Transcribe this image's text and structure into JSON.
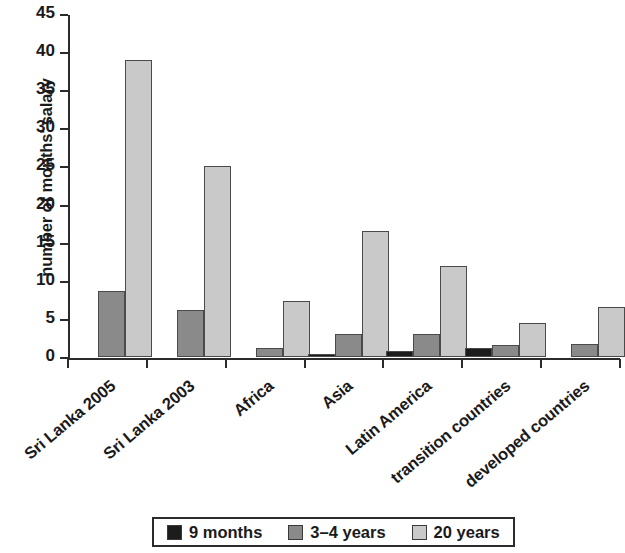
{
  "chart_data": {
    "type": "bar",
    "title": "",
    "subtitle": "",
    "xlabel": "",
    "ylabel": "number of months' salary",
    "ylim": [
      0,
      45
    ],
    "ytick_step": 5,
    "ytick_labels": [
      "0",
      "5",
      "10",
      "15",
      "20",
      "25",
      "30",
      "35",
      "40",
      "45"
    ],
    "grid": false,
    "legend_position": "bottom",
    "categories": [
      "Sri Lanka 2005",
      "Sri Lanka 2003",
      "Africa",
      "Asia",
      "Latin America",
      "transition countries",
      "developed countries"
    ],
    "series": [
      {
        "name": "9 months",
        "color": "#1c1c1c",
        "values": [
          0,
          0,
          0,
          0.4,
          0.8,
          1.2,
          0
        ]
      },
      {
        "name": "3–4 years",
        "color": "#8a8a8a",
        "values": [
          8.7,
          6.2,
          1.2,
          3.0,
          3.0,
          1.6,
          1.7
        ]
      },
      {
        "name": "20 years",
        "color": "#c9c9c9",
        "values": [
          39.0,
          25.0,
          7.3,
          16.5,
          12.0,
          4.5,
          6.6
        ]
      }
    ]
  },
  "legend": {
    "items": [
      {
        "label": "9 months",
        "color": "#1c1c1c"
      },
      {
        "label": "3–4 years",
        "color": "#8a8a8a"
      },
      {
        "label": "20 years",
        "color": "#c9c9c9"
      }
    ]
  },
  "axis": {
    "y_title": "number of months' salary"
  }
}
